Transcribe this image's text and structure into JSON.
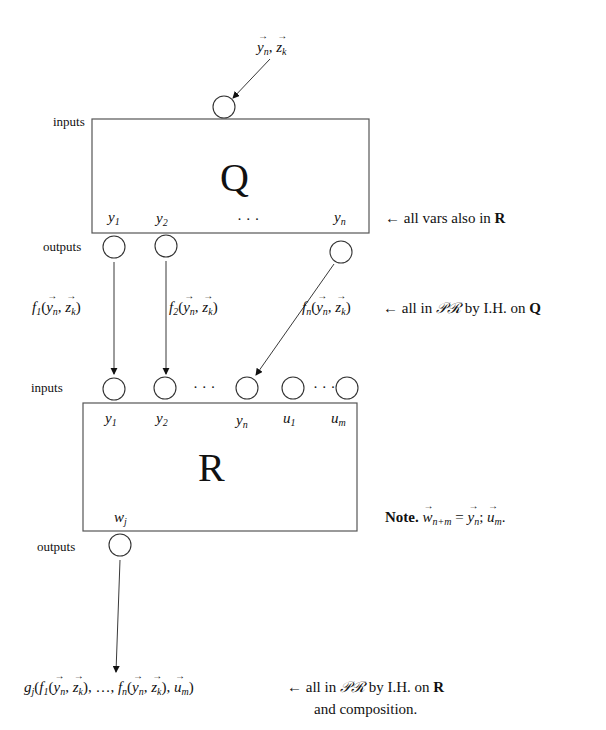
{
  "diagram": {
    "top_input": "y⃗n, z⃗k",
    "q_box": {
      "name": "Q",
      "inputs_label": "inputs",
      "outputs_label": "outputs",
      "output_vars": [
        "y1",
        "y2",
        "…",
        "yn"
      ],
      "note": "← all vars also in R"
    },
    "edges": {
      "f1": "f1(y⃗n, z⃗k)",
      "f2": "f2(y⃗n, z⃗k)",
      "fn": "fn(y⃗n, z⃗k)",
      "fn_note": "← all in 𝒫ℛ by I.H. on Q"
    },
    "r_box": {
      "name": "R",
      "inputs_label": "inputs",
      "outputs_label": "outputs",
      "input_vars": [
        "y1",
        "y2",
        "yn",
        "u1",
        "um"
      ],
      "output_var": "wj",
      "note": "Note. w⃗n+m = y⃗n; u⃗m."
    },
    "result": {
      "expression": "gj(f1(y⃗n, z⃗k), …, fn(y⃗n, z⃗k), u⃗m)",
      "note_line1": "← all in 𝒫ℛ by I.H. on R",
      "note_line2": "and composition."
    }
  },
  "text": {
    "inputs": "inputs",
    "outputs": "outputs",
    "Q": "Q",
    "R": "R",
    "dots": "· · ·",
    "arrow_left": "←",
    "q_note_text": "all vars also in",
    "q_note_bold": "R",
    "fn_note_text": "all in",
    "pr": "𝒫ℛ",
    "by_ih_on": "by I.H. on",
    "bold_Q": "Q",
    "bold_R": "R",
    "note_word": "Note.",
    "and_composition": "and composition.",
    "y": "y",
    "z": "z",
    "u": "u",
    "w": "w",
    "f": "f",
    "g": "g",
    "sub_1": "1",
    "sub_2": "2",
    "sub_n": "n",
    "sub_k": "k",
    "sub_m": "m",
    "sub_j": "j",
    "sub_nm": "n+m",
    "comma": ", ",
    "lparen": "(",
    "rparen": ")",
    "ellipsis": ", …, ",
    "equals": " = ",
    "semicolon": "; ",
    "period": "."
  }
}
